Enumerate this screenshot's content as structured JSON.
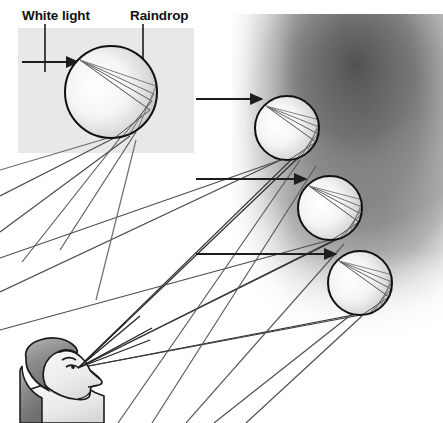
{
  "figure": {
    "width": 443,
    "height": 423,
    "background_color": "#ffffff"
  },
  "labels": [
    {
      "id": "white-light",
      "text": "White light",
      "x": 22,
      "y": 18,
      "leader": {
        "x": 44,
        "y": 24,
        "length": 32
      }
    },
    {
      "id": "raindrop",
      "text": "Raindrop",
      "x": 130,
      "y": 18,
      "leader": {
        "x": 143,
        "y": 24,
        "length": 88
      }
    }
  ],
  "panel": {
    "name": "inset-panel",
    "x": 18,
    "y": 28,
    "width": 176,
    "height": 125,
    "fill": "#e8e8e8"
  },
  "cloud": {
    "name": "dark-cloud-gradient",
    "description": "Dark gray gradient mass representing the rain shower region",
    "x": 240,
    "y": 18,
    "width": 203,
    "height": 320,
    "dark_color": "#5a5a5a",
    "light_color": "#ffffff"
  },
  "raindrops": [
    {
      "id": "drop-1",
      "cx": 111,
      "cy": 92,
      "r": 47,
      "incoming_arrow_y": 62,
      "arrow_start_x": 22
    },
    {
      "id": "drop-2",
      "cx": 287,
      "cy": 128,
      "r": 33,
      "incoming_arrow_y": 99,
      "arrow_start_x": 196
    },
    {
      "id": "drop-3",
      "cx": 330,
      "cy": 208,
      "r": 33,
      "incoming_arrow_y": 179,
      "arrow_start_x": 196
    },
    {
      "id": "drop-4",
      "cx": 360,
      "cy": 283,
      "r": 33,
      "incoming_arrow_y": 254,
      "arrow_start_x": 196
    }
  ],
  "observer": {
    "name": "observer-head",
    "description": "Person looking upward toward the rainbow",
    "eye_x": 78,
    "eye_y": 368,
    "hair_color": "#8a8a8a",
    "skin_color": "#efefef",
    "outline_color": "#1a1a1a"
  },
  "colors": {
    "ray_dark": "#2b2b2b",
    "ray_light": "#6b6b6b",
    "drop_outline": "#111111",
    "panel_gray": "#e8e8e8",
    "text": "#111111"
  },
  "annotations": {
    "ray_count_to_eye": 6,
    "incoming_ray_count": 4
  }
}
